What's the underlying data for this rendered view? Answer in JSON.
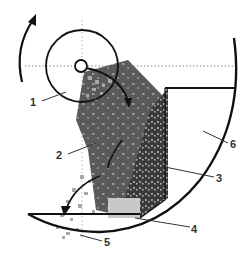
{
  "figure": {
    "labels": [
      {
        "id": "1",
        "text": "1"
      },
      {
        "id": "2",
        "text": "2"
      },
      {
        "id": "3",
        "text": "3"
      },
      {
        "id": "4",
        "text": "4"
      },
      {
        "id": "5",
        "text": "5"
      },
      {
        "id": "6",
        "text": "6"
      }
    ],
    "rotation_direction": "counter-clockwise",
    "colors": {
      "outline": "#111111",
      "dark_zone": "#5a5a5a",
      "speckle_zone": "#3a3a3a",
      "particle": "#a8a8a8",
      "light_particle": "#c8c8c8",
      "axis_dots": "#888888"
    }
  }
}
